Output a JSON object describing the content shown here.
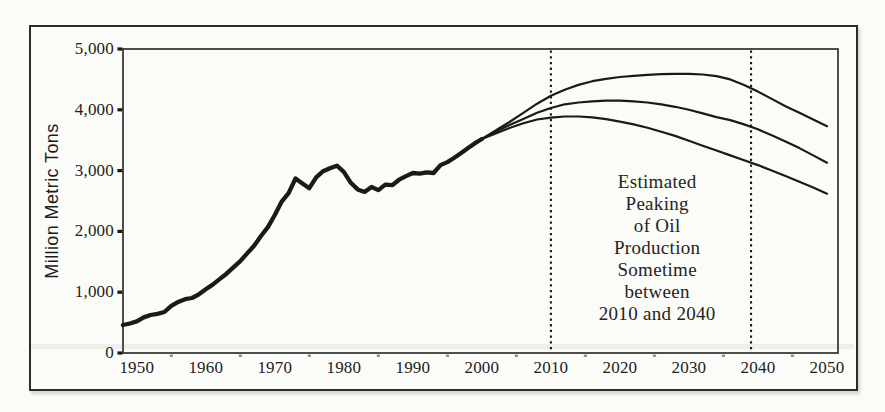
{
  "figure": {
    "background": "#fbfbf8",
    "border_color": "#2b2b2b"
  },
  "chart_data": {
    "type": "line",
    "title": "",
    "xlabel": "",
    "ylabel": "Million Metric Tons",
    "xlim": [
      1948,
      2051.6
    ],
    "ylim": [
      0,
      5000
    ],
    "grid": false,
    "legend": "none",
    "colors": {
      "ink": "#1a1a1a",
      "frame": "#2f2f2f",
      "minor_tick": "#8f8c84"
    },
    "y_ticks": [
      {
        "value": 0,
        "label": "0"
      },
      {
        "value": 1000,
        "label": "1,000"
      },
      {
        "value": 2000,
        "label": "2,000"
      },
      {
        "value": 3000,
        "label": "3,000"
      },
      {
        "value": 4000,
        "label": "4,000"
      },
      {
        "value": 5000,
        "label": "5,000"
      }
    ],
    "x_ticks": [
      {
        "value": 1950,
        "label": "1950"
      },
      {
        "value": 1960,
        "label": "1960"
      },
      {
        "value": 1970,
        "label": "1970"
      },
      {
        "value": 1980,
        "label": "1980"
      },
      {
        "value": 1990,
        "label": "1990"
      },
      {
        "value": 2000,
        "label": "2000"
      },
      {
        "value": 2010,
        "label": "2010"
      },
      {
        "value": 2020,
        "label": "2020"
      },
      {
        "value": 2030,
        "label": "2030"
      },
      {
        "value": 2040,
        "label": "2040"
      },
      {
        "value": 2050,
        "label": "2050"
      }
    ],
    "minor_x_ticks": [
      1955,
      1965,
      1975,
      1985,
      1995,
      2005,
      2015,
      2025,
      2035,
      2045
    ],
    "reference_lines": {
      "style": "vertical-dotted",
      "years": [
        2010,
        2039
      ]
    },
    "annotation": {
      "lines": [
        "Estimated",
        "Peaking",
        "of Oil",
        "Production",
        "Sometime",
        "between",
        "2010 and 2040"
      ],
      "center_year": 2025.4,
      "center_value": 1730
    },
    "series": [
      {
        "name": "historical-production",
        "style": "thick",
        "points": [
          [
            1948,
            460
          ],
          [
            1949,
            485
          ],
          [
            1950,
            520
          ],
          [
            1951,
            585
          ],
          [
            1952,
            625
          ],
          [
            1953,
            645
          ],
          [
            1954,
            675
          ],
          [
            1955,
            775
          ],
          [
            1956,
            840
          ],
          [
            1957,
            885
          ],
          [
            1958,
            905
          ],
          [
            1959,
            965
          ],
          [
            1960,
            1050
          ],
          [
            1961,
            1125
          ],
          [
            1962,
            1215
          ],
          [
            1963,
            1305
          ],
          [
            1964,
            1410
          ],
          [
            1965,
            1510
          ],
          [
            1966,
            1640
          ],
          [
            1967,
            1765
          ],
          [
            1968,
            1925
          ],
          [
            1969,
            2070
          ],
          [
            1970,
            2270
          ],
          [
            1971,
            2490
          ],
          [
            1972,
            2630
          ],
          [
            1973,
            2870
          ],
          [
            1974,
            2790
          ],
          [
            1975,
            2710
          ],
          [
            1976,
            2890
          ],
          [
            1977,
            2990
          ],
          [
            1978,
            3040
          ],
          [
            1979,
            3080
          ],
          [
            1980,
            2980
          ],
          [
            1981,
            2800
          ],
          [
            1982,
            2690
          ],
          [
            1983,
            2650
          ],
          [
            1984,
            2730
          ],
          [
            1985,
            2680
          ],
          [
            1986,
            2770
          ],
          [
            1987,
            2760
          ],
          [
            1988,
            2850
          ],
          [
            1989,
            2910
          ],
          [
            1990,
            2960
          ],
          [
            1991,
            2950
          ],
          [
            1992,
            2970
          ],
          [
            1993,
            2960
          ],
          [
            1994,
            3090
          ],
          [
            1995,
            3140
          ],
          [
            1996,
            3210
          ],
          [
            1997,
            3290
          ],
          [
            1998,
            3370
          ],
          [
            1999,
            3450
          ],
          [
            2000,
            3520
          ]
        ]
      },
      {
        "name": "scenario-high-peak-2030",
        "style": "thin",
        "points": [
          [
            2000,
            3520
          ],
          [
            2002,
            3660
          ],
          [
            2004,
            3800
          ],
          [
            2006,
            3950
          ],
          [
            2008,
            4100
          ],
          [
            2010,
            4230
          ],
          [
            2012,
            4330
          ],
          [
            2014,
            4410
          ],
          [
            2016,
            4470
          ],
          [
            2018,
            4510
          ],
          [
            2020,
            4540
          ],
          [
            2022,
            4560
          ],
          [
            2024,
            4575
          ],
          [
            2026,
            4585
          ],
          [
            2028,
            4590
          ],
          [
            2030,
            4590
          ],
          [
            2032,
            4580
          ],
          [
            2034,
            4555
          ],
          [
            2036,
            4500
          ],
          [
            2038,
            4410
          ],
          [
            2040,
            4300
          ],
          [
            2042,
            4180
          ],
          [
            2044,
            4060
          ],
          [
            2046,
            3950
          ],
          [
            2048,
            3840
          ],
          [
            2050,
            3730
          ]
        ]
      },
      {
        "name": "scenario-mid-peak-2020",
        "style": "thin",
        "points": [
          [
            2000,
            3520
          ],
          [
            2002,
            3640
          ],
          [
            2004,
            3750
          ],
          [
            2006,
            3850
          ],
          [
            2008,
            3950
          ],
          [
            2010,
            4030
          ],
          [
            2012,
            4090
          ],
          [
            2014,
            4120
          ],
          [
            2016,
            4140
          ],
          [
            2018,
            4150
          ],
          [
            2020,
            4150
          ],
          [
            2022,
            4140
          ],
          [
            2024,
            4120
          ],
          [
            2026,
            4090
          ],
          [
            2028,
            4050
          ],
          [
            2030,
            4000
          ],
          [
            2032,
            3940
          ],
          [
            2034,
            3880
          ],
          [
            2036,
            3830
          ],
          [
            2038,
            3760
          ],
          [
            2040,
            3680
          ],
          [
            2042,
            3580
          ],
          [
            2044,
            3480
          ],
          [
            2046,
            3370
          ],
          [
            2048,
            3250
          ],
          [
            2050,
            3130
          ]
        ]
      },
      {
        "name": "scenario-low-peak-2010",
        "style": "thin",
        "points": [
          [
            2000,
            3520
          ],
          [
            2002,
            3610
          ],
          [
            2004,
            3700
          ],
          [
            2006,
            3780
          ],
          [
            2008,
            3840
          ],
          [
            2010,
            3870
          ],
          [
            2012,
            3890
          ],
          [
            2014,
            3890
          ],
          [
            2016,
            3875
          ],
          [
            2018,
            3845
          ],
          [
            2020,
            3805
          ],
          [
            2022,
            3760
          ],
          [
            2024,
            3705
          ],
          [
            2026,
            3640
          ],
          [
            2028,
            3570
          ],
          [
            2030,
            3490
          ],
          [
            2032,
            3410
          ],
          [
            2034,
            3330
          ],
          [
            2036,
            3250
          ],
          [
            2038,
            3170
          ],
          [
            2040,
            3090
          ],
          [
            2042,
            3000
          ],
          [
            2044,
            2910
          ],
          [
            2046,
            2815
          ],
          [
            2048,
            2720
          ],
          [
            2050,
            2620
          ]
        ]
      }
    ]
  }
}
